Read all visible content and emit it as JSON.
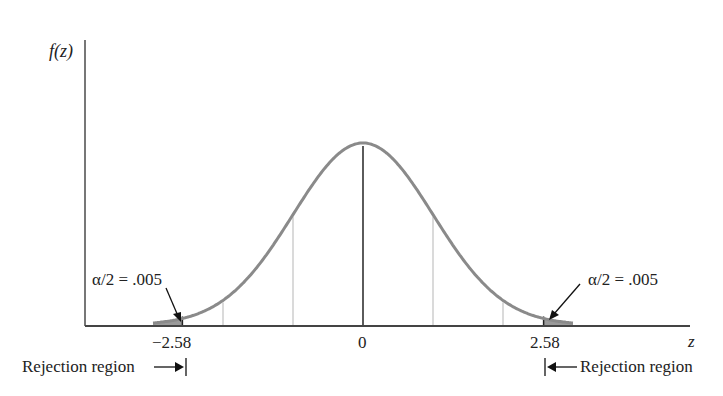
{
  "chart_data": {
    "type": "area",
    "title": "",
    "xlabel": "z",
    "ylabel": "f(z)",
    "x_ticks": [
      {
        "value": -2.58,
        "label": "−2.58"
      },
      {
        "value": 0,
        "label": "0"
      },
      {
        "value": 2.58,
        "label": "2.58"
      }
    ],
    "gridlines_at": [
      -2,
      -1,
      1,
      2
    ],
    "center_line_at": 0,
    "critical_values": [
      -2.58,
      2.58
    ],
    "tail_area_each": 0.005,
    "annotations": [
      {
        "text": "α/2 = .005",
        "points_to": -2.58,
        "side": "left"
      },
      {
        "text": "α/2 = .005",
        "points_to": 2.58,
        "side": "right"
      },
      {
        "text": "Rejection region",
        "arrow": "right",
        "at": -2.58
      },
      {
        "text": "Rejection region",
        "arrow": "left",
        "at": 2.58
      }
    ],
    "xlim": [
      -4.0,
      4.7
    ],
    "curve_color": "#8a8a8a",
    "shade_color": "#999999",
    "axis_color": "#444444"
  },
  "labels": {
    "ylabel": "f(z)",
    "xlabel": "z",
    "tick_neg": "−2.58",
    "tick_zero": "0",
    "tick_pos": "2.58",
    "alpha_left": "α/2 = .005",
    "alpha_right": "α/2 = .005",
    "reject_left": "Rejection region",
    "reject_right": "Rejection region"
  }
}
